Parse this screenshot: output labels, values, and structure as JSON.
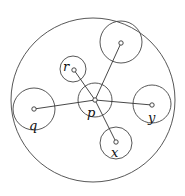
{
  "diagram": {
    "type": "nested-circles-star-graph",
    "outer_circle": {
      "cx": 93,
      "cy": 100,
      "r": 82
    },
    "center": {
      "id": "p",
      "label": "p",
      "x": 95,
      "y": 100,
      "circle_r": 17,
      "label_x": 87,
      "label_y": 117
    },
    "nodes": [
      {
        "id": "r",
        "label": "r",
        "x": 74,
        "y": 70,
        "circle_cx": 73,
        "circle_cy": 69,
        "circle_r": 13,
        "label_x": 63,
        "label_y": 71
      },
      {
        "id": "top",
        "label": "",
        "x": 121,
        "y": 43,
        "circle_cx": 121,
        "circle_cy": 42,
        "circle_r": 21,
        "label_x": 0,
        "label_y": 0
      },
      {
        "id": "q",
        "label": "q",
        "x": 34,
        "y": 109,
        "circle_cx": 34,
        "circle_cy": 109,
        "circle_r": 21,
        "label_x": 29,
        "label_y": 130
      },
      {
        "id": "y",
        "label": "y",
        "x": 152,
        "y": 105,
        "circle_cx": 152,
        "circle_cy": 104,
        "circle_r": 19,
        "label_x": 148,
        "label_y": 122
      },
      {
        "id": "x",
        "label": "x",
        "x": 116,
        "y": 142,
        "circle_cx": 116,
        "circle_cy": 143,
        "circle_r": 16,
        "label_x": 111,
        "label_y": 157
      }
    ],
    "edges": [
      {
        "from": "p",
        "to": "r"
      },
      {
        "from": "p",
        "to": "top"
      },
      {
        "from": "p",
        "to": "q"
      },
      {
        "from": "p",
        "to": "y"
      },
      {
        "from": "p",
        "to": "x"
      }
    ],
    "colors": {
      "stroke": "#333333",
      "background": "#ffffff"
    }
  }
}
